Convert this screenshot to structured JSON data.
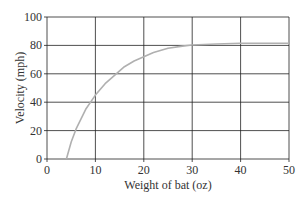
{
  "chart_data": {
    "type": "line",
    "title": "",
    "xlabel": "Weight of bat (oz)",
    "ylabel": "Velocity (mph)",
    "xlim": [
      0,
      50
    ],
    "ylim": [
      0,
      100
    ],
    "x_ticks": [
      0,
      10,
      20,
      30,
      40,
      50
    ],
    "y_ticks": [
      0,
      20,
      40,
      60,
      80,
      100
    ],
    "grid": true,
    "legend": null,
    "series": [
      {
        "name": "Velocity",
        "color": "#b0b0b0",
        "x": [
          4,
          5,
          6,
          8,
          10,
          12,
          14,
          16,
          18,
          20,
          22,
          25,
          28,
          30,
          35,
          40,
          45,
          50
        ],
        "y": [
          0,
          12,
          21,
          35,
          45,
          53,
          59,
          65,
          69,
          72,
          75,
          78,
          79.5,
          80.3,
          81,
          81.5,
          81.5,
          81.5
        ]
      }
    ]
  }
}
